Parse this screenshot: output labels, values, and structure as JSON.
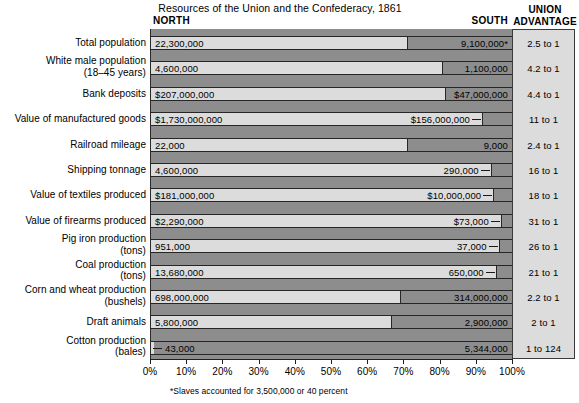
{
  "title": "Resources of the Union and the Confederacy, 1861",
  "headers": {
    "north": "NORTH",
    "south": "SOUTH",
    "advantage_line1": "UNION",
    "advantage_line2": "ADVANTAGE"
  },
  "footnote": "*Slaves accounted for 3,500,000 or 40 percent",
  "colors": {
    "north_bar": "#dcdcdc",
    "south_bar": "#8d8d8d",
    "advantage_panel": "#dcdcdc",
    "outline": "#262626",
    "text": "#000000"
  },
  "axis": {
    "ticks": [
      "0%",
      "10%",
      "20%",
      "30%",
      "40%",
      "50%",
      "60%",
      "70%",
      "80%",
      "90%",
      "100%"
    ],
    "min": 0,
    "max": 100
  },
  "chart_data": {
    "type": "bar",
    "orientation": "horizontal",
    "stacked": true,
    "normalized_percent": true,
    "title": "Resources of the Union and the Confederacy, 1861",
    "xlabel": "",
    "ylabel": "",
    "xlim": [
      0,
      100
    ],
    "grid": false,
    "legend_position": "top",
    "series": [
      {
        "name": "NORTH",
        "color": "#dcdcdc"
      },
      {
        "name": "SOUTH",
        "color": "#8d8d8d"
      }
    ],
    "categories": [
      "Total population",
      "White male population (18–45 years)",
      "Bank deposits",
      "Value of manufactured goods",
      "Railroad mileage",
      "Shipping tonnage",
      "Value of textiles produced",
      "Value of firearms produced",
      "Pig iron production (tons)",
      "Coal production (tons)",
      "Corn and wheat production (bushels)",
      "Draft animals",
      "Cotton production (bales)"
    ],
    "rows": [
      {
        "label_line1": "Total population",
        "label_line2": "",
        "north_label": "22,300,000",
        "south_label": "9,100,000*",
        "north_value": 22300000,
        "south_value": 9100000,
        "north_percent": 71.0,
        "south_percent": 29.0,
        "advantage": "2.5 to 1",
        "south_label_outside": false,
        "north_label_outside": false
      },
      {
        "label_line1": "White male population",
        "label_line2": "(18–45 years)",
        "north_label": "4,600,000",
        "south_label": "1,100,000",
        "north_value": 4600000,
        "south_value": 1100000,
        "north_percent": 80.7,
        "south_percent": 19.3,
        "advantage": "4.2 to 1",
        "south_label_outside": false,
        "north_label_outside": false
      },
      {
        "label_line1": "Bank deposits",
        "label_line2": "",
        "north_label": "$207,000,000",
        "south_label": "$47,000,000",
        "north_value": 207000000,
        "south_value": 47000000,
        "north_percent": 81.5,
        "south_percent": 18.5,
        "advantage": "4.4 to 1",
        "south_label_outside": false,
        "north_label_outside": false
      },
      {
        "label_line1": "Value of manufactured goods",
        "label_line2": "",
        "north_label": "$1,730,000,000",
        "south_label": "$156,000,000",
        "north_value": 1730000000,
        "south_value": 156000000,
        "north_percent": 91.7,
        "south_percent": 8.3,
        "advantage": "11 to 1",
        "south_label_outside": true,
        "north_label_outside": false
      },
      {
        "label_line1": "Railroad mileage",
        "label_line2": "",
        "north_label": "22,000",
        "south_label": "9,000",
        "north_value": 22000,
        "south_value": 9000,
        "north_percent": 71.0,
        "south_percent": 29.0,
        "advantage": "2.4 to 1",
        "south_label_outside": false,
        "north_label_outside": false
      },
      {
        "label_line1": "Shipping tonnage",
        "label_line2": "",
        "north_label": "4,600,000",
        "south_label": "290,000",
        "north_value": 4600000,
        "south_value": 290000,
        "north_percent": 94.1,
        "south_percent": 5.9,
        "advantage": "16 to 1",
        "south_label_outside": true,
        "north_label_outside": false
      },
      {
        "label_line1": "Value of textiles produced",
        "label_line2": "",
        "north_label": "$181,000,000",
        "south_label": "$10,000,000",
        "north_value": 181000000,
        "south_value": 10000000,
        "north_percent": 94.8,
        "south_percent": 5.2,
        "advantage": "18 to 1",
        "south_label_outside": true,
        "north_label_outside": false
      },
      {
        "label_line1": "Value of firearms produced",
        "label_line2": "",
        "north_label": "$2,290,000",
        "south_label": "$73,000",
        "north_value": 2290000,
        "south_value": 73000,
        "north_percent": 96.9,
        "south_percent": 3.1,
        "advantage": "31 to 1",
        "south_label_outside": true,
        "north_label_outside": false
      },
      {
        "label_line1": "Pig iron production",
        "label_line2": "(tons)",
        "north_label": "951,000",
        "south_label": "37,000",
        "north_value": 951000,
        "south_value": 37000,
        "north_percent": 96.3,
        "south_percent": 3.7,
        "advantage": "26 to 1",
        "south_label_outside": true,
        "north_label_outside": false
      },
      {
        "label_line1": "Coal production",
        "label_line2": "(tons)",
        "north_label": "13,680,000",
        "south_label": "650,000",
        "north_value": 13680000,
        "south_value": 650000,
        "north_percent": 95.5,
        "south_percent": 4.5,
        "advantage": "21 to 1",
        "south_label_outside": true,
        "north_label_outside": false
      },
      {
        "label_line1": "Corn and wheat production",
        "label_line2": "(bushels)",
        "north_label": "698,000,000",
        "south_label": "314,000,000",
        "north_value": 698000000,
        "south_value": 314000000,
        "north_percent": 69.0,
        "south_percent": 31.0,
        "advantage": "2.2 to 1",
        "south_label_outside": false,
        "north_label_outside": false
      },
      {
        "label_line1": "Draft animals",
        "label_line2": "",
        "north_label": "5,800,000",
        "south_label": "2,900,000",
        "north_value": 5800000,
        "south_value": 2900000,
        "north_percent": 66.7,
        "south_percent": 33.3,
        "advantage": "2 to 1",
        "south_label_outside": false,
        "north_label_outside": false
      },
      {
        "label_line1": "Cotton production",
        "label_line2": "(bales)",
        "north_label": "43,000",
        "south_label": "5,344,000",
        "north_value": 43000,
        "south_value": 5344000,
        "north_percent": 0.8,
        "south_percent": 99.2,
        "advantage": "1 to 124",
        "south_label_outside": false,
        "north_label_outside": true
      }
    ]
  }
}
